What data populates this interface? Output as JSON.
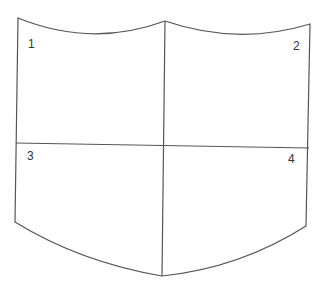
{
  "diagram": {
    "type": "shield-quadrants",
    "stroke_color": "#555555",
    "background": "#ffffff",
    "labels": [
      {
        "id": "q1",
        "text": "1",
        "x": 28,
        "y": 48
      },
      {
        "id": "q2",
        "text": "2",
        "x": 293,
        "y": 50
      },
      {
        "id": "q3",
        "text": "3",
        "x": 27,
        "y": 160
      },
      {
        "id": "q4",
        "text": "4",
        "x": 288,
        "y": 163
      }
    ]
  }
}
